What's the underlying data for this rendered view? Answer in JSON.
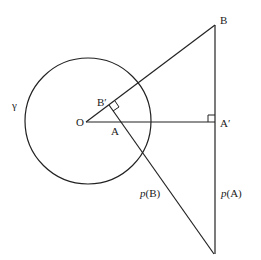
{
  "diagram": {
    "stroke_color": "#222222",
    "background": "#ffffff",
    "circle": {
      "label": "γ",
      "cx": 88,
      "cy": 121,
      "r": 63
    },
    "points": {
      "O": {
        "label": "O",
        "x": 86,
        "y": 122
      },
      "A": {
        "label": "A",
        "x": 113,
        "y": 122
      },
      "B": {
        "label": "B",
        "x": 215,
        "y": 25
      },
      "B_prime": {
        "label": "B′",
        "x": 109,
        "y": 105
      },
      "A_prime": {
        "label": "A′",
        "x": 215,
        "y": 122
      },
      "bottom": {
        "x": 214,
        "y": 254
      }
    },
    "lines": {
      "pB": {
        "label_prefix": "p",
        "label_arg": "(B)"
      },
      "pA": {
        "label_prefix": "p",
        "label_arg": "(A)"
      }
    }
  }
}
